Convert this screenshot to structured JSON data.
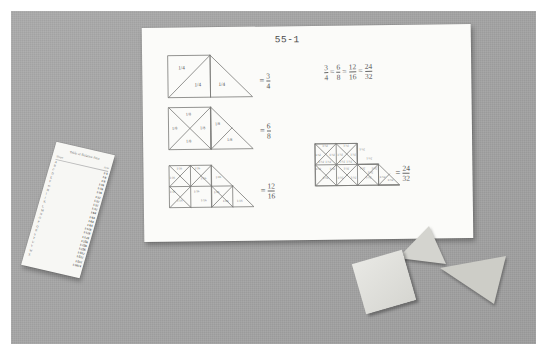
{
  "scene": {
    "title": "fraction-equivalence-worksheet-photo",
    "surface_color": "#a5a5a5",
    "paper_color": "#fbfbf9"
  },
  "worksheet": {
    "code": "55-1",
    "equation_line": "3/4 = 6/8 = 12/16 = 24/32",
    "equation_parts": [
      {
        "num": "3",
        "den": "4"
      },
      {
        "num": "6",
        "den": "8"
      },
      {
        "num": "12",
        "den": "16"
      },
      {
        "num": "24",
        "den": "32"
      }
    ],
    "figures": [
      {
        "id": "figure-quarters",
        "piece_label": "1/4",
        "piece_count": 3,
        "result_num": "3",
        "result_den": "4",
        "labels": [
          "1/4",
          "1/4",
          "1/4"
        ]
      },
      {
        "id": "figure-eighths",
        "piece_label": "1/8",
        "piece_count": 6,
        "result_num": "6",
        "result_den": "8",
        "labels": [
          "1/8",
          "1/8",
          "1/8",
          "1/8",
          "1/8",
          "1/8"
        ]
      },
      {
        "id": "figure-sixteenths",
        "piece_label": "1/16",
        "piece_count": 12,
        "result_num": "12",
        "result_den": "16",
        "labels": [
          "1/16",
          "1/16",
          "1/16",
          "1/16",
          "1/16",
          "1/16",
          "1/16",
          "1/16",
          "1/16",
          "1/16",
          "1/16",
          "1/16"
        ]
      },
      {
        "id": "figure-thirtyseconds",
        "piece_label": "1/32",
        "piece_count": 24,
        "result_num": "24",
        "result_den": "32",
        "labels": [
          "1/32",
          "1/32",
          "1/32",
          "1/32",
          "1/32",
          "1/32",
          "1/32",
          "1/32",
          "1/32",
          "1/32",
          "1/32",
          "1/32",
          "1/32",
          "1/32",
          "1/32",
          "1/32",
          "1/32",
          "1/32",
          "1/32",
          "1/32",
          "1/32",
          "1/32",
          "1/32",
          "1/32"
        ]
      }
    ],
    "equals_sign": "="
  },
  "strip": {
    "title": "Table of Relative Area",
    "headers": [
      "Shape",
      "Area"
    ],
    "rows": [
      {
        "c1": "A",
        "c2": "1/4"
      },
      {
        "c1": "B",
        "c2": "1/8"
      },
      {
        "c1": "C",
        "c2": "1/8"
      },
      {
        "c1": "D",
        "c2": "1/16"
      },
      {
        "c1": "E",
        "c2": "1/16"
      },
      {
        "c1": "F",
        "c2": "1/16"
      },
      {
        "c1": "G",
        "c2": "1/32"
      },
      {
        "c1": "H",
        "c2": "1/32"
      },
      {
        "c1": "I",
        "c2": "1/32"
      },
      {
        "c1": "J",
        "c2": "1/32"
      },
      {
        "c1": "K",
        "c2": "1/64"
      },
      {
        "c1": "L",
        "c2": "1/64"
      },
      {
        "c1": "M",
        "c2": "1/64"
      },
      {
        "c1": "N",
        "c2": "1/64"
      },
      {
        "c1": "O",
        "c2": "1/128"
      },
      {
        "c1": "P",
        "c2": "1/128"
      },
      {
        "c1": "Q",
        "c2": "1/128"
      },
      {
        "c1": "R",
        "c2": "1/256"
      },
      {
        "c1": "S",
        "c2": "1/256"
      },
      {
        "c1": "T",
        "c2": "1/256"
      },
      {
        "c1": "U",
        "c2": "1/512"
      },
      {
        "c1": "V",
        "c2": "1/512"
      },
      {
        "c1": "W",
        "c2": "1/512"
      },
      {
        "c1": "X",
        "c2": "1/1024"
      }
    ]
  },
  "cut_shapes": [
    {
      "name": "paper-triangle-upper",
      "shape": "triangle",
      "color": "#d9d9d4"
    },
    {
      "name": "paper-square",
      "shape": "square",
      "color": "#e2e2de"
    },
    {
      "name": "paper-triangle-right",
      "shape": "triangle",
      "color": "#cfcfc9"
    }
  ]
}
